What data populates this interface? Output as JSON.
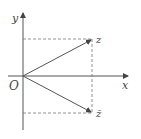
{
  "diagram": {
    "title": "",
    "axes": {
      "x_label": "x",
      "y_label": "y",
      "origin_label": "O"
    },
    "points": [
      {
        "label": "z",
        "position": "first quadrant"
      },
      {
        "label": "z̄",
        "position": "fourth quadrant"
      }
    ],
    "colors": {
      "line": "#555555",
      "dashed": "#777777",
      "text": "#444444"
    }
  }
}
